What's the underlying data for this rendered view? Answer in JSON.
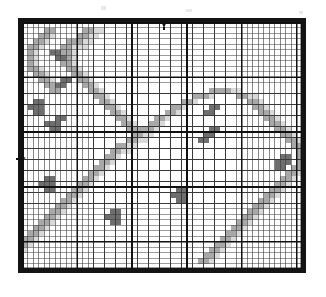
{
  "document": {
    "type": "counted-pattern-chart",
    "title": "Filet / Cross-Stitch Pattern Chart",
    "description": "Monochrome squared pattern chart with three fill shades on a 51 x 45 cell grid, heavy black border, bold gridlines every 10 cells and centre-point arrow markers on the top and left edges."
  },
  "chart_data": {
    "type": "heatmap",
    "subtitle": "",
    "xlabel": "",
    "ylabel": "",
    "columns": 51,
    "rows": 45,
    "grid": true,
    "legend_position": "none",
    "axis_ranges": {
      "x": [
        1,
        51
      ],
      "y": [
        1,
        45
      ]
    },
    "tick_labels": {
      "x": [],
      "y": []
    },
    "annotations": [
      {
        "name": "top-centre-arrow",
        "edge": "top",
        "column": 26,
        "symbol": "down-arrow"
      },
      {
        "name": "left-centre-arrow",
        "edge": "left",
        "row": 25,
        "symbol": "right-arrow"
      }
    ],
    "legend": [
      {
        "key": "0",
        "label": "Empty / background",
        "color": "#ffffff"
      },
      {
        "key": "1",
        "label": "Light shade",
        "color": "#d9d9d9"
      },
      {
        "key": "2",
        "label": "Medium shade",
        "color": "#a8a8a8"
      },
      {
        "key": "3",
        "label": "Dark shade",
        "color": "#6e6e6e"
      }
    ],
    "palette": [
      "#ffffff",
      "#d9d9d9",
      "#a8a8a8",
      "#6e6e6e"
    ],
    "gridline_color": "#3a3a3a",
    "major_gridline_color": "#111111",
    "major_gridline_every": 10,
    "border_color": "#141414",
    "cell_counts": {
      "empty": 1173,
      "light": 540,
      "medium": 410,
      "dark": 172
    },
    "values": [
      "000000000000000000000000000000000000000000000000000",
      "000022000002211000000000000000000000000000000000000",
      "000221000022110000000000000000000000000000000000000",
      "002210002221100000000000000000000000000000000000000",
      "022100022111000000000000000000000000000000000000000",
      "021003322100000000000000000000000000000000000000000",
      "021000332100000000000000000000000000000000000000000",
      "021000022100000000000000000000000000000000000000000",
      "022100002210000000000000000000000000000000000000000",
      "002210000221000000000000000000000000000000000000000",
      "000221033022100000000000000000000000000000000000000",
      "000022330002210000000000000000000000000000000000000",
      "000002200000221000000000000000000022221100000000000",
      "000000000000022100000000000000022210000221100000000",
      "003300000000002210000000000002210000000002210000000",
      "033300000000000221000000000221000033000000221000000",
      "003300000000000022100000002210000330000000022100000",
      "000000330000000002210000221000000000000000002210000",
      "000033300000000000221002210000000000000000000221000",
      "000003300000000000022222100000000033000000000022100",
      "000000000000000000002211000000000330000000000002210",
      "000000000000000000022110000000003300000000000000221",
      "000000000000000002211000000000000000000000000000022",
      "000000000000000022110000000000000000000000000000002",
      "000000000000000221000000000000000000000000000003302",
      "000000000000002210000000000000000000000000000033302",
      "000000000000022100000000000000000000000000000033022",
      "000000000000221000000000000000000000000000000000221",
      "000033000002210000000000000000000000000000000002210",
      "000333000022100000000000000000000000000000000022100",
      "000033000221000000000000000033000000000000000221000",
      "000000002210000000000000000333000000000000002210000",
      "000000022100000000000000000033000000000000022100000",
      "000000221000000000000000000000000000000000221000000",
      "000002210000000033000000000000000000000002210000000",
      "000022100000000333000000000000000000000022100000000",
      "000221000000000033000000000000000000000221000000000",
      "002210000000000000000000000000000000002210000000000",
      "022100000000000000000000000000000000022100000000000",
      "221000000000000000000000000000000000221000000000000",
      "210000000000000000000000000000000002210000000000000",
      "100000000000000000000000000000000022100000000000000",
      "000000000000000000000000000000000221000000000000000",
      "000000000000000000000000000000002210000000000000000",
      "000000000000000000000000000000000000000000000000000"
    ]
  }
}
